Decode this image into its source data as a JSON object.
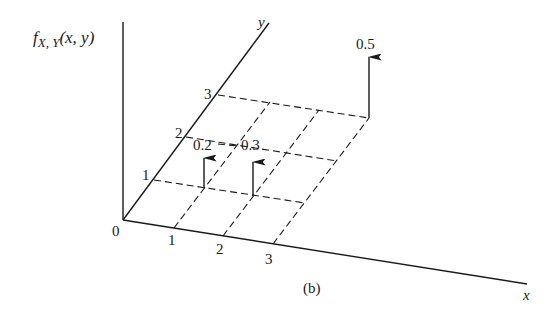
{
  "figure": {
    "caption": "(b)",
    "z_axis_label": {
      "f": "f",
      "sub": "X, Y",
      "args": "(x, y)"
    },
    "x_axis_label": "x",
    "y_axis_label": "y",
    "origin_label": "0",
    "x_ticks": [
      "1",
      "2",
      "3"
    ],
    "y_ticks": [
      "1",
      "2",
      "3"
    ],
    "masses": [
      {
        "x": 1,
        "y": 1,
        "label": "0.2"
      },
      {
        "x": 2,
        "y": 1,
        "label": "0.3"
      },
      {
        "x": 3,
        "y": 3,
        "label": "0.5"
      }
    ],
    "colors": {
      "ink": "#1a1a1a",
      "background": "#ffffff"
    }
  }
}
